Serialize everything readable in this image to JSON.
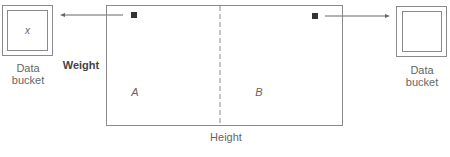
{
  "diagram": {
    "left_bucket": {
      "label_line1": "Data",
      "label_line2": "bucket",
      "content": "x"
    },
    "right_bucket": {
      "label_line1": "Data",
      "label_line2": "bucket",
      "content": ""
    },
    "axis_labels": {
      "vertical": "Weight",
      "horizontal": "Height"
    },
    "regions": [
      {
        "label": "A"
      },
      {
        "label": "B"
      }
    ],
    "colors": {
      "line": "#8a8a8a",
      "marker": "#333333",
      "text": "#666666"
    }
  }
}
